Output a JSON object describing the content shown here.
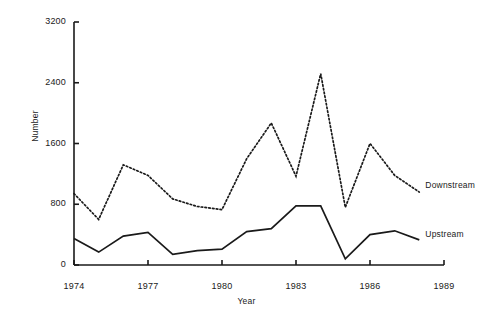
{
  "chart_data": {
    "type": "line",
    "title": "",
    "xlabel": "Year",
    "ylabel": "Number",
    "x": [
      1974,
      1975,
      1976,
      1977,
      1978,
      1979,
      1980,
      1981,
      1982,
      1983,
      1984,
      1985,
      1986,
      1987,
      1988
    ],
    "xlim": [
      1974,
      1989
    ],
    "ylim": [
      0,
      3200
    ],
    "xticks": [
      1974,
      1977,
      1980,
      1983,
      1986,
      1989
    ],
    "yticks": [
      0,
      800,
      1600,
      2400,
      3200
    ],
    "xtick_labels": [
      "1974",
      "1977",
      "1980",
      "1983",
      "1986",
      "1989"
    ],
    "ytick_labels": [
      "0",
      "800",
      "1600",
      "2400",
      "3200"
    ],
    "grid": false,
    "legend_position": "right-inline",
    "series": [
      {
        "name": "Downstream",
        "style": "dotted",
        "color": "#1a1a1a",
        "values": [
          940,
          600,
          1320,
          1180,
          870,
          770,
          730,
          1400,
          1870,
          1170,
          2520,
          760,
          1600,
          1180,
          960
        ]
      },
      {
        "name": "Upstream",
        "style": "solid",
        "color": "#1a1a1a",
        "values": [
          350,
          170,
          380,
          430,
          140,
          190,
          210,
          440,
          480,
          780,
          780,
          80,
          400,
          450,
          330
        ]
      }
    ]
  },
  "labels": {
    "y_axis_title": "Number",
    "x_axis_title": "Year",
    "downstream": "Downstream",
    "upstream": "Upstream"
  },
  "colors": {
    "axis": "#1a1a1a",
    "series": "#1a1a1a",
    "background": "#ffffff"
  }
}
